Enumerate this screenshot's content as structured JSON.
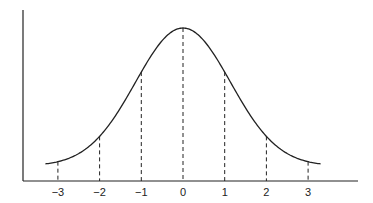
{
  "chart_data": {
    "type": "line",
    "title": "",
    "xlabel": "",
    "ylabel": "",
    "x_ticks": [
      -3,
      -2,
      -1,
      0,
      1,
      2,
      3
    ],
    "tick_labels": [
      "−3",
      "−2",
      "−1",
      "0",
      "1",
      "2",
      "3"
    ],
    "xlim": [
      -3.3,
      3.3
    ],
    "series": [
      {
        "name": "normal-curve",
        "mean": 0,
        "sd": 1
      }
    ],
    "dashed_lines_at": [
      -3,
      -2,
      -1,
      0,
      1,
      2,
      3
    ],
    "grid": false,
    "legend": "none",
    "colors": {
      "line": "#222222",
      "axis": "#222222"
    }
  }
}
